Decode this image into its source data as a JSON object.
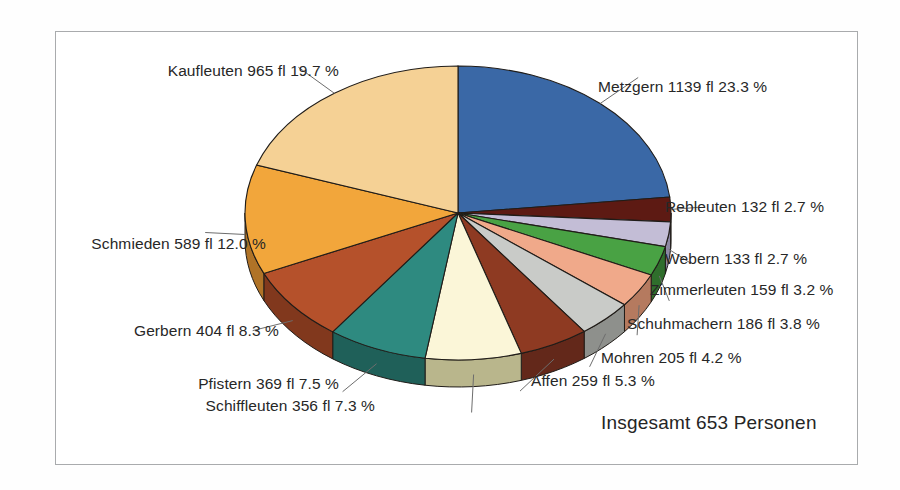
{
  "figure": {
    "total_label": "Insgesamt 653 Personen",
    "frame_color": "#a9abad",
    "background": "#ffffff"
  },
  "chart_data": {
    "type": "pie",
    "title": "",
    "subtitle": "",
    "xlabel": "",
    "ylabel": "",
    "legend_position": "callout-labels",
    "grid": false,
    "unit": "fl",
    "total_persons": 653,
    "start_angle_deg": 0,
    "direction": "clockwise",
    "three_d": true,
    "categories": [
      "Metzgern",
      "Rebleuten",
      "Webern",
      "Zimmerleuten",
      "Schuhmachern",
      "Mohren",
      "Affen",
      "Schiffleuten",
      "Pfistern",
      "Gerbern",
      "Schmieden",
      "Kaufleuten"
    ],
    "values": [
      1139,
      132,
      133,
      159,
      186,
      205,
      259,
      356,
      369,
      404,
      589,
      965
    ],
    "percents": [
      23.3,
      2.7,
      2.7,
      3.2,
      3.8,
      4.2,
      5.3,
      7.3,
      7.5,
      8.3,
      12.0,
      19.7
    ],
    "colors": [
      "#3a68a6",
      "#5d1a13",
      "#c3bdd6",
      "#49a244",
      "#f0a98a",
      "#c9cbc8",
      "#8e3a22",
      "#fbf6d8",
      "#2e8a80",
      "#b5512b",
      "#f2a63b",
      "#f5d195"
    ],
    "side_colors": [
      "#2a4c7b",
      "#3e120d",
      "#8d87a3",
      "#2f6e2c",
      "#b57a5f",
      "#8e908c",
      "#63281a",
      "#b9b68c",
      "#1f6059",
      "#81381d",
      "#b07327",
      "#b8934f"
    ],
    "slices": [
      {
        "name": "Metzgern",
        "value": 1139,
        "pct": 23.3,
        "label": "Metzgern 1139 fl  23.3 %"
      },
      {
        "name": "Rebleuten",
        "value": 132,
        "pct": 2.7,
        "label": "Rebleuten 132 fl  2.7 %"
      },
      {
        "name": "Webern",
        "value": 133,
        "pct": 2.7,
        "label": "Webern 133 fl  2.7 %"
      },
      {
        "name": "Zimmerleuten",
        "value": 159,
        "pct": 3.2,
        "label": "Zimmerleuten 159 fl  3.2 %"
      },
      {
        "name": "Schuhmachern",
        "value": 186,
        "pct": 3.8,
        "label": "Schuhmachern 186 fl  3.8 %"
      },
      {
        "name": "Mohren",
        "value": 205,
        "pct": 4.2,
        "label": "Mohren 205 fl  4.2 %"
      },
      {
        "name": "Affen",
        "value": 259,
        "pct": 5.3,
        "label": "Affen 259 fl  5.3 %"
      },
      {
        "name": "Schiffleuten",
        "value": 356,
        "pct": 7.3,
        "label": "Schiffleuten 356 fl  7.3 %"
      },
      {
        "name": "Pfistern",
        "value": 369,
        "pct": 7.5,
        "label": "Pfistern 369 fl  7.5 %"
      },
      {
        "name": "Gerbern",
        "value": 404,
        "pct": 8.3,
        "label": "Gerbern 404 fl  8.3 %"
      },
      {
        "name": "Schmieden",
        "value": 589,
        "pct": 12.0,
        "label": "Schmieden 589 fl  12.0 %"
      },
      {
        "name": "Kaufleuten",
        "value": 965,
        "pct": 19.7,
        "label": "Kaufleuten 965 fl  19.7 %"
      }
    ]
  }
}
